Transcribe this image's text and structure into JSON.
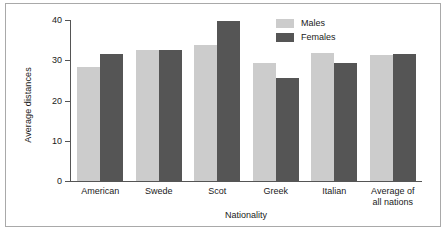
{
  "chart_data": {
    "type": "bar",
    "title": "",
    "xlabel": "Nationality",
    "ylabel": "Average distances",
    "categories": [
      "American",
      "Swede",
      "Scot",
      "Greek",
      "Italian",
      "Average of\nall nations"
    ],
    "series": [
      {
        "name": "Males",
        "color": "#cccccc",
        "values": [
          28.3,
          32.5,
          33.7,
          29.2,
          31.7,
          31.2
        ]
      },
      {
        "name": "Females",
        "color": "#555555",
        "values": [
          31.5,
          32.5,
          39.8,
          25.6,
          29.3,
          31.6
        ]
      }
    ],
    "ylim": [
      0,
      40
    ],
    "yticks": [
      0,
      10,
      20,
      30,
      40
    ],
    "ytick_labels": [
      "0",
      "10",
      "20",
      "30",
      "40"
    ],
    "grid": false,
    "legend_position": "top-right"
  },
  "axis": {
    "color": "#555555"
  }
}
